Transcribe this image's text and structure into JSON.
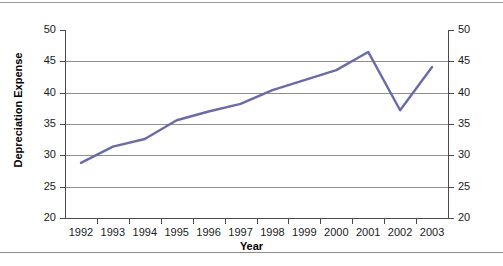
{
  "chart_data": {
    "type": "line",
    "title": "",
    "xlabel": "Year",
    "ylabel": "Depreciation Expense",
    "categories": [
      "1992",
      "1993",
      "1994",
      "1995",
      "1996",
      "1997",
      "1998",
      "1999",
      "2000",
      "2001",
      "2002",
      "2003"
    ],
    "values": [
      28.8,
      31.4,
      32.6,
      35.6,
      37.0,
      38.2,
      40.4,
      42.0,
      43.6,
      46.5,
      37.2,
      44.1
    ],
    "series": [
      {
        "name": "Depreciation Expense",
        "values": [
          28.8,
          31.4,
          32.6,
          35.6,
          37.0,
          38.2,
          40.4,
          42.0,
          43.6,
          46.5,
          37.2,
          44.1
        ]
      }
    ],
    "ylim": [
      20,
      50
    ],
    "ytick_labels_left": [
      "50",
      "45",
      "40",
      "35",
      "30",
      "25",
      "20"
    ],
    "ytick_labels_right": [
      "50",
      "45",
      "40",
      "35",
      "30",
      "25",
      "20"
    ],
    "ytick_values": [
      50,
      45,
      40,
      35,
      30,
      25,
      20
    ],
    "grid": true,
    "grid_axis": "y",
    "legend": false,
    "legend_position": "none",
    "line_color": "#6b6ba8",
    "line_width": 2.4,
    "markers": false,
    "dual_y_axis": true
  },
  "axes": {
    "x_title": "Year",
    "y_title": "Depreciation Expense"
  },
  "colors": {
    "line": "#6b6ba8",
    "grid": "#8e8e8e",
    "axis": "#4a4a4a",
    "text": "#1a1a1a",
    "background": "#ffffff",
    "page_rule": "#9a9a9a"
  }
}
